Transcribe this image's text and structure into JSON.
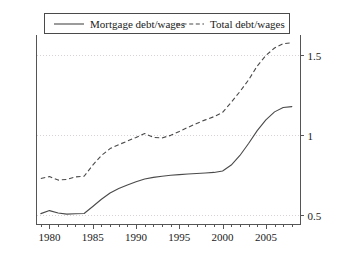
{
  "chart_data": {
    "type": "line",
    "title": "",
    "subtitle": "",
    "xlabel": "",
    "ylabel": "",
    "xlim": [
      1978.5,
      2009.0
    ],
    "ylim": [
      0.44,
      1.62
    ],
    "xticks": [
      1980,
      1985,
      1990,
      1995,
      2000,
      2005
    ],
    "xticklabels": [
      "1980",
      "1985",
      "1990",
      "1995",
      "2000",
      "2005"
    ],
    "yticks": [
      0.5,
      1,
      1.5
    ],
    "yticklabels": [
      "0.5",
      "1",
      "1.5"
    ],
    "y_axis_side": "right",
    "grid": true,
    "grid_axis": "y",
    "grid_style": "dotted",
    "legend": {
      "position": "top-center",
      "entries": [
        {
          "label": "Mortgage debt/wages",
          "style": "solid"
        },
        {
          "label": "Total debt/wages",
          "style": "dashed"
        }
      ]
    },
    "series": [
      {
        "name": "Mortgage debt/wages",
        "style": "solid",
        "x": [
          1979,
          1980,
          1981,
          1982,
          1983,
          1984,
          1985,
          1986,
          1987,
          1988,
          1989,
          1990,
          1991,
          1992,
          1993,
          1994,
          1995,
          1996,
          1997,
          1998,
          1999,
          2000,
          2001,
          2002,
          2003,
          2004,
          2005,
          2006,
          2007,
          2008
        ],
        "y": [
          0.508,
          0.527,
          0.512,
          0.505,
          0.507,
          0.509,
          0.553,
          0.598,
          0.637,
          0.665,
          0.687,
          0.707,
          0.725,
          0.735,
          0.742,
          0.748,
          0.752,
          0.756,
          0.759,
          0.762,
          0.766,
          0.775,
          0.812,
          0.872,
          0.947,
          1.028,
          1.095,
          1.145,
          1.172,
          1.178
        ]
      },
      {
        "name": "Total debt/wages",
        "style": "dashed",
        "x": [
          1979,
          1980,
          1981,
          1982,
          1983,
          1984,
          1985,
          1986,
          1987,
          1988,
          1989,
          1990,
          1991,
          1992,
          1993,
          1994,
          1995,
          1996,
          1997,
          1998,
          1999,
          2000,
          2001,
          2002,
          2003,
          2004,
          2005,
          2006,
          2007,
          2008
        ],
        "y": [
          0.728,
          0.74,
          0.718,
          0.722,
          0.738,
          0.742,
          0.812,
          0.872,
          0.915,
          0.94,
          0.962,
          0.985,
          1.01,
          0.985,
          0.982,
          0.998,
          1.022,
          1.048,
          1.072,
          1.095,
          1.115,
          1.142,
          1.205,
          1.272,
          1.345,
          1.432,
          1.498,
          1.545,
          1.572,
          1.578
        ]
      }
    ]
  }
}
